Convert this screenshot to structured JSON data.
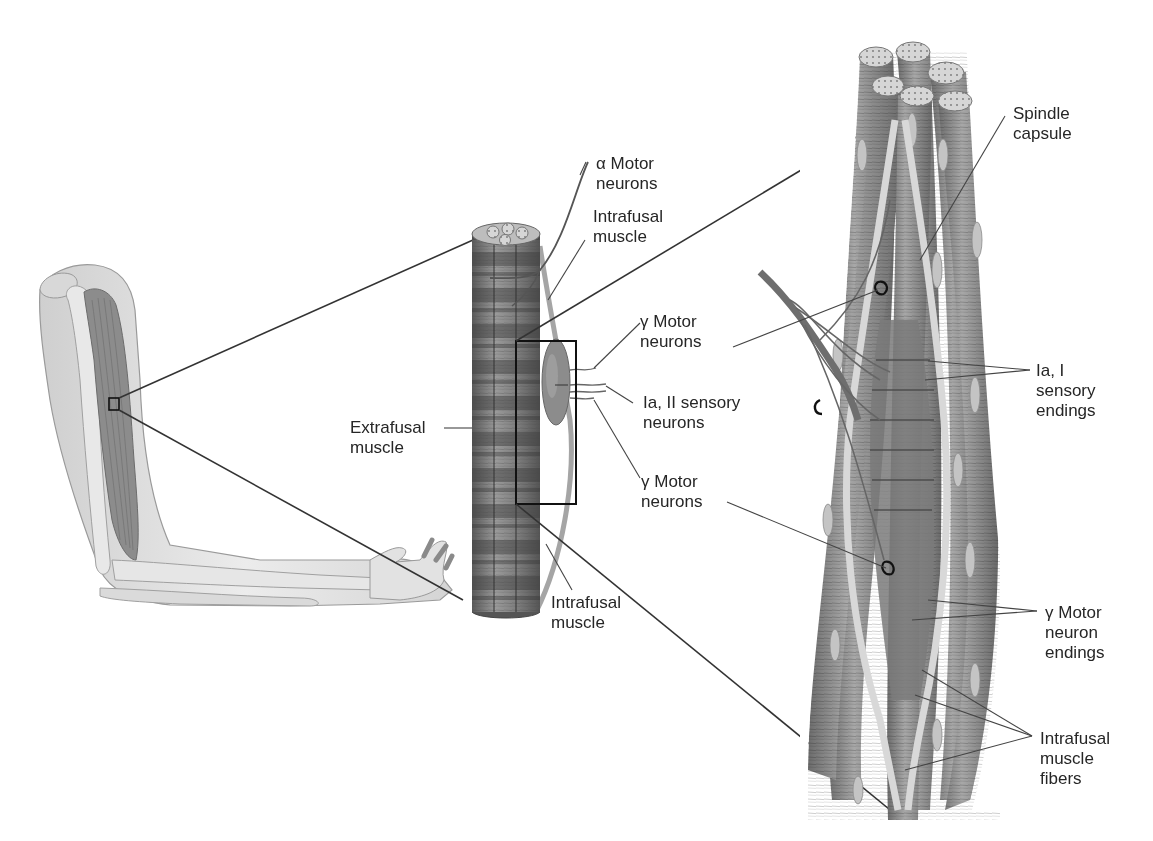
{
  "diagram": {
    "type": "anatomical-illustration",
    "panels": [
      "arm",
      "muscle-bundle",
      "muscle-spindle-detail"
    ],
    "colors": {
      "background": "#ffffff",
      "skin": "#e2e2e2",
      "muscle": "#8a8a8a",
      "muscle_dark": "#5e5e5e",
      "outline": "#3a3a3a",
      "leader_line": "#444444",
      "text": "#262626"
    }
  },
  "labels": {
    "alpha_motor": "α Motor\nneurons",
    "intrafusal_top": "Intrafusal\nmuscle",
    "gamma_motor_1": "γ Motor\nneurons",
    "ia_ii_sensory": "Ia, II sensory\nneurons",
    "gamma_motor_2": "γ Motor\nneurons",
    "extrafusal": "Extrafusal\nmuscle",
    "intrafusal_bottom": "Intrafusal\nmuscle",
    "spindle_capsule": "Spindle\ncapsule",
    "ia_i_sensory_endings": "Ia, I\nsensory\nendings",
    "gamma_motor_endings": "γ Motor\nneuron\nendings",
    "intrafusal_fibers": "Intrafusal\nmuscle\nfibers"
  }
}
